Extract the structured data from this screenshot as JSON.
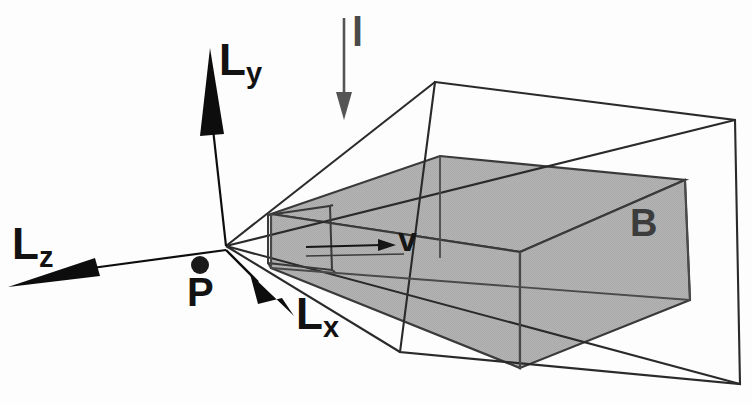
{
  "figure": {
    "type": "technical-line-diagram",
    "background_color": "#fdfdfd",
    "line_color": "#2a2a2a",
    "fill_color": "#b2b2b2",
    "arrow_color": "#0d0d0d",
    "light_arrow_color": "#555555"
  },
  "labels": {
    "axis_y": {
      "base": "L",
      "sub": "y"
    },
    "axis_z": {
      "base": "L",
      "sub": "z"
    },
    "axis_x": {
      "base": "L",
      "sub": "x"
    },
    "point": "P",
    "light": "l",
    "body": "B",
    "view_vector": "v"
  },
  "annotations": [
    {
      "name": "light-direction-arrow",
      "label": "l",
      "direction": "down",
      "from": [
        344,
        18
      ],
      "to": [
        344,
        118
      ]
    },
    {
      "name": "axis-y-arrow",
      "label": "Ly",
      "from": [
        226,
        245
      ],
      "to": [
        210,
        50
      ]
    },
    {
      "name": "axis-z-arrow",
      "label": "Lz",
      "from": [
        226,
        250
      ],
      "to": [
        8,
        287
      ]
    },
    {
      "name": "axis-x-arrow",
      "label": "Lx",
      "from": [
        226,
        250
      ],
      "to": [
        294,
        316
      ]
    },
    {
      "name": "view-vector-arrow",
      "label": "v",
      "from": [
        306,
        247
      ],
      "to": [
        393,
        244
      ]
    },
    {
      "name": "eye-point",
      "label": "P",
      "at": [
        200,
        265
      ],
      "radius": 9
    }
  ],
  "geometry": {
    "apex": [
      226,
      246
    ],
    "frustum_far_plane": [
      [
        435,
        82
      ],
      [
        735,
        120
      ],
      [
        740,
        384
      ],
      [
        400,
        352
      ]
    ],
    "near_plane": [
      [
        268,
        215
      ],
      [
        330,
        205
      ],
      [
        332,
        268
      ],
      [
        268,
        262
      ]
    ],
    "shaded_body_name": "B"
  }
}
